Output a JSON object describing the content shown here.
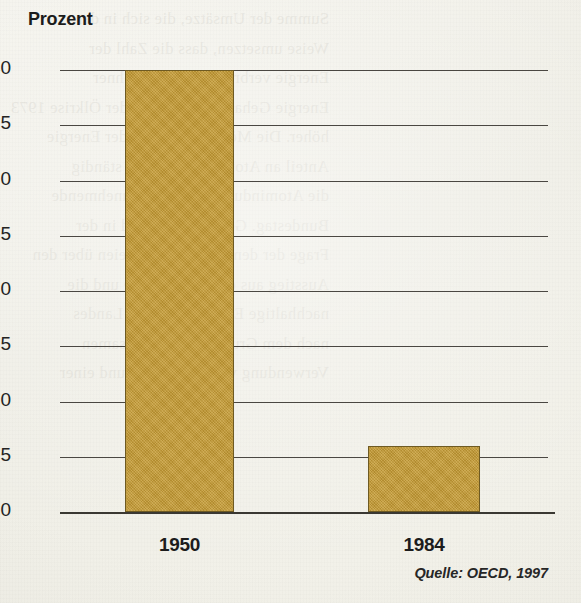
{
  "chart_data": {
    "type": "bar",
    "title": "Prozent",
    "xlabel": "",
    "ylabel": "Prozent",
    "categories": [
      "1950",
      "1984"
    ],
    "values": [
      40,
      6
    ],
    "ylim": [
      0,
      40
    ],
    "yticks": [
      0,
      5,
      10,
      15,
      20,
      25,
      30,
      35,
      40
    ],
    "ytick_labels": [
      "0",
      "5",
      "10",
      "15",
      "20",
      "25",
      "30",
      "35",
      "40"
    ],
    "grid": true,
    "legend": null,
    "series": [
      {
        "name": "Prozent",
        "values": [
          40,
          6
        ],
        "color": "#c49a33"
      }
    ],
    "annotations": {
      "source": "Quelle: OECD, 1997"
    }
  },
  "colors": {
    "bar_fill": "#c49a33",
    "bar_outline": "#6e5a22",
    "gridline": "#4a4742",
    "axis": "#3a3832",
    "text": "#1c1c1c",
    "paper": "#f2f1ea"
  },
  "bleed_through_lines": [
    "Summe der Umsätze, die sich in der",
    "Weise umsetzen, dass die Zahl der",
    "Energie verbrauch pro Einwohner",
    "Energie Gehalt nach Beginn der Ölkrise 1973",
    "höher. Die Möglichkeit, von der Energie",
    "Anteil an Atomstrom ist aber ständig",
    "die Atomindustrie auf eine zunehmende",
    "Bundestag. Gegenwärtig wird in der",
    "Frage der dem Streit der Parteien über den",
    "Ausstieg aus der Kernenergie und die",
    "nachhaltige Entwicklung des Landes",
    "nach dem Grundsatz der sparsamen",
    "Verwendung von Rohstoffen und einer"
  ]
}
